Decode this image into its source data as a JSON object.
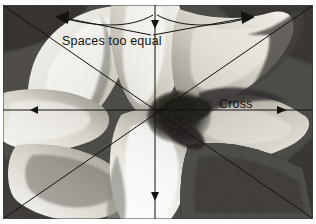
{
  "figure": {
    "kind": "photograph-with-composition-overlay",
    "frame_color": "#4b4b4b",
    "overlay_color": "#1a1a1a",
    "background_color": "#ffffff",
    "annotations": [
      {
        "id": "spaces-too-equal",
        "text": "Spaces too equal",
        "x": 62,
        "y": 34
      },
      {
        "id": "cross",
        "text": "Cross",
        "x": 219,
        "y": 97
      }
    ],
    "overlay": {
      "center": {
        "x": 152,
        "y": 105
      },
      "lines": [
        {
          "name": "horizontal-axis",
          "from": [
            0,
            105
          ],
          "to": [
            310,
            105
          ],
          "arrow": "both"
        },
        {
          "name": "vertical-axis",
          "from": [
            152,
            0
          ],
          "to": [
            152,
            214
          ],
          "arrow": "both"
        },
        {
          "name": "diagonal-tl-br",
          "from": [
            0,
            0
          ],
          "to": [
            310,
            214
          ],
          "arrow": "none"
        },
        {
          "name": "diagonal-bl-tr",
          "from": [
            0,
            214
          ],
          "to": [
            310,
            0
          ],
          "arrow": "none"
        },
        {
          "name": "arc-left",
          "from": [
            152,
            12
          ],
          "to": [
            52,
            16
          ],
          "arrow": "end"
        },
        {
          "name": "arc-right",
          "from": [
            152,
            12
          ],
          "to": [
            252,
            16
          ],
          "arrow": "end"
        },
        {
          "name": "vee-left",
          "from": [
            150,
            30
          ],
          "to": [
            52,
            16
          ],
          "arrow": "end"
        },
        {
          "name": "vee-right",
          "from": [
            150,
            30
          ],
          "to": [
            252,
            16
          ],
          "arrow": "end"
        }
      ]
    },
    "tones": {
      "petal_highlight": "#f4f2ec",
      "petal_light": "#d8d5cc",
      "petal_mid": "#a8a49a",
      "petal_shadow": "#6f6c64",
      "background_dark": "#3c3a36",
      "stamen_dark": "#252321"
    }
  }
}
